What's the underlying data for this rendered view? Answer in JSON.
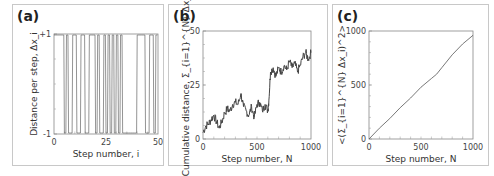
{
  "panels": [
    {
      "label": "(a)"
    },
    {
      "label": "(b)"
    },
    {
      "label": "(c)"
    }
  ],
  "chart_data": [
    {
      "type": "line",
      "panel": "(a)",
      "title": "",
      "xlabel": "Step number, i",
      "ylabel": "Distance per step, Δx_i",
      "xticks": [
        "0",
        "25",
        "50"
      ],
      "yticks": [
        "-1",
        "+1"
      ],
      "xlim": [
        0,
        50
      ],
      "ylim": [
        -1,
        1
      ],
      "grid": false,
      "steps": [
        1,
        1,
        1,
        1,
        1,
        -1,
        1,
        -1,
        -1,
        1,
        1,
        -1,
        -1,
        1,
        1,
        -1,
        -1,
        1,
        1,
        1,
        -1,
        1,
        -1,
        -1,
        1,
        -1,
        1,
        -1,
        1,
        -1,
        1,
        -1,
        1,
        -1,
        -1,
        -1,
        -1,
        -1,
        -1,
        -1,
        1,
        1,
        1,
        1,
        -1,
        -1,
        1,
        1,
        -1,
        1
      ]
    },
    {
      "type": "line",
      "panel": "(b)",
      "title": "",
      "xlabel": "Step number, N",
      "ylabel": "Cumulative distance, Σ_{i=1}^{N} Δx_i",
      "xticks": [
        "0",
        "500",
        "1000"
      ],
      "yticks": [
        "0",
        "25",
        "50"
      ],
      "xlim": [
        0,
        1000
      ],
      "ylim": [
        0,
        50
      ],
      "grid": false,
      "x": [
        0,
        25,
        50,
        75,
        100,
        125,
        150,
        175,
        200,
        225,
        250,
        275,
        300,
        325,
        350,
        375,
        400,
        425,
        450,
        475,
        500,
        525,
        550,
        575,
        600,
        610,
        625,
        650,
        675,
        700,
        725,
        750,
        775,
        800,
        825,
        850,
        875,
        900,
        925,
        950,
        975,
        1000
      ],
      "values": [
        3,
        6,
        7,
        9,
        11,
        8,
        5,
        8,
        12,
        14,
        13,
        16,
        17,
        16,
        21,
        15,
        13,
        11,
        15,
        10,
        16,
        17,
        13,
        16,
        13,
        18,
        31,
        33,
        29,
        33,
        31,
        34,
        32,
        36,
        33,
        35,
        31,
        34,
        38,
        40,
        37,
        40
      ]
    },
    {
      "type": "line",
      "panel": "(c)",
      "title": "",
      "xlabel": "Step number, N",
      "ylabel": "<(Σ_{i=1}^{N} Δx_i)^2>",
      "xticks": [
        "0",
        "500",
        "1000"
      ],
      "yticks": [
        "0",
        "500",
        "1000"
      ],
      "xlim": [
        0,
        1000
      ],
      "ylim": [
        0,
        1000
      ],
      "grid": false,
      "x": [
        0,
        100,
        200,
        300,
        400,
        500,
        600,
        650,
        700,
        800,
        900,
        1000
      ],
      "values": [
        0,
        100,
        190,
        290,
        380,
        480,
        560,
        600,
        660,
        780,
        880,
        960
      ]
    }
  ]
}
